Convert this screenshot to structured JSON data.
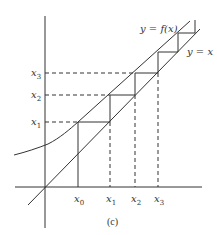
{
  "figure": {
    "caption": "(c)",
    "curve_label": "y = f(x)",
    "diagonal_label": "y = x",
    "x_ticks": [
      {
        "base": "x",
        "sub": "0"
      },
      {
        "base": "x",
        "sub": "1"
      },
      {
        "base": "x",
        "sub": "2"
      },
      {
        "base": "x",
        "sub": "3"
      }
    ],
    "y_ticks": [
      {
        "base": "x",
        "sub": "1"
      },
      {
        "base": "x",
        "sub": "2"
      },
      {
        "base": "x",
        "sub": "3"
      }
    ],
    "colors": {
      "line": "#333333",
      "background": "#ffffff"
    }
  }
}
